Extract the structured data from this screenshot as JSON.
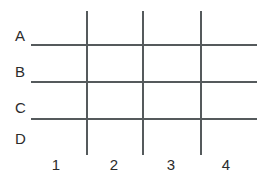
{
  "diagram": {
    "type": "grid",
    "background_color": "#ffffff",
    "line_color": "#555a5c",
    "label_color": "#2b2b2b",
    "row_labels": [
      {
        "text": "A",
        "x": 15,
        "y": 28
      },
      {
        "text": "B",
        "x": 15,
        "y": 64
      },
      {
        "text": "C",
        "x": 15,
        "y": 100
      },
      {
        "text": "D",
        "x": 15,
        "y": 131
      }
    ],
    "col_labels": [
      {
        "text": "1",
        "x": 46,
        "y": 157,
        "width": 20
      },
      {
        "text": "2",
        "x": 104,
        "y": 157,
        "width": 20
      },
      {
        "text": "3",
        "x": 161,
        "y": 157,
        "width": 20
      },
      {
        "text": "4",
        "x": 216,
        "y": 157,
        "width": 20
      }
    ],
    "horizontal_lines": [
      {
        "x": 31,
        "y": 44,
        "length": 226
      },
      {
        "x": 31,
        "y": 81,
        "length": 226
      },
      {
        "x": 31,
        "y": 118,
        "length": 226
      }
    ],
    "vertical_lines": [
      {
        "x": 86,
        "y": 11,
        "length": 144
      },
      {
        "x": 142,
        "y": 11,
        "length": 144
      },
      {
        "x": 200,
        "y": 11,
        "length": 144
      }
    ]
  }
}
